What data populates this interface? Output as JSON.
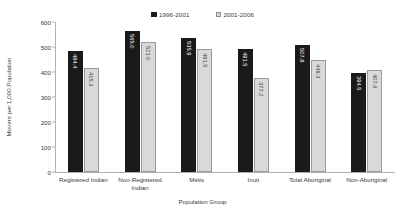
{
  "chart_data": {
    "type": "bar",
    "title": "",
    "subtitle": "",
    "xlabel": "Population Group",
    "ylabel": "Movers per 1,000 Population",
    "categories": [
      "Registered Indian",
      "Non-Registered Indian",
      "Métis",
      "Inuit",
      "Total Aboriginal",
      "Non-Aboriginal"
    ],
    "series": [
      {
        "name": "1996-2001",
        "color": "#1a1a1a",
        "values": [
          484.4,
          565.0,
          535.9,
          491.5,
          507.8,
          394.5
        ],
        "labels": [
          "484.4",
          "565.0",
          "535.9",
          "491.5",
          "507.8",
          "394.5"
        ]
      },
      {
        "name": "2001-2006",
        "color": "#d9d9d9",
        "values": [
          415.3,
          521.0,
          491.5,
          377.2,
          449.3,
          407.6
        ],
        "labels": [
          "415.3",
          "521.0",
          "491.5",
          "377.2",
          "449.3",
          "407.6"
        ]
      }
    ],
    "ylim": [
      0,
      600
    ],
    "ytick_step": 100,
    "yticks": [
      0,
      100,
      200,
      300,
      400,
      500,
      600
    ],
    "ytick_labels": [
      "0",
      "100",
      "200",
      "300",
      "400",
      "500",
      "600"
    ],
    "grid": false,
    "legend_position": "top-center",
    "bar_labels_rotated": true
  }
}
